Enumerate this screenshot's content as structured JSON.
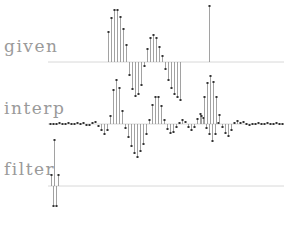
{
  "labels": {
    "given": "given",
    "interp": "interp",
    "filter": "filter"
  },
  "colors": {
    "stem": "#8a8a8a",
    "marker": "#333333",
    "baseline": "#d8d8d8",
    "label": "#9a9a9a"
  },
  "chart_data": {
    "type": "stem",
    "title": "",
    "panels": [
      {
        "name": "given",
        "baseline_y": 62,
        "x_start": 48,
        "x_end": 284,
        "points": [
          [
            108,
            -30
          ],
          [
            111,
            -44
          ],
          [
            114,
            -52
          ],
          [
            117,
            -52
          ],
          [
            120,
            -45
          ],
          [
            123,
            -33
          ],
          [
            126,
            -17
          ],
          [
            129,
            13
          ],
          [
            132,
            27
          ],
          [
            135,
            34
          ],
          [
            138,
            32
          ],
          [
            141,
            23
          ],
          [
            144,
            4
          ],
          [
            147,
            -13
          ],
          [
            150,
            -24
          ],
          [
            153,
            -27
          ],
          [
            156,
            -24
          ],
          [
            159,
            -15
          ],
          [
            162,
            -6
          ],
          [
            165,
            7
          ],
          [
            168,
            18
          ],
          [
            171,
            26
          ],
          [
            174,
            32
          ],
          [
            177,
            35
          ],
          [
            180,
            38
          ],
          [
            209,
            -56
          ]
        ]
      },
      {
        "name": "interp",
        "baseline_y": 124,
        "x_start": 48,
        "x_end": 284,
        "points": [
          [
            50,
            0
          ],
          [
            53,
            0
          ],
          [
            56,
            0
          ],
          [
            59,
            -1
          ],
          [
            62,
            0
          ],
          [
            65,
            0
          ],
          [
            68,
            -1
          ],
          [
            71,
            0
          ],
          [
            74,
            0
          ],
          [
            77,
            -1
          ],
          [
            80,
            0
          ],
          [
            83,
            -1
          ],
          [
            86,
            1
          ],
          [
            89,
            1
          ],
          [
            92,
            -1
          ],
          [
            95,
            -2
          ],
          [
            98,
            2
          ],
          [
            101,
            6
          ],
          [
            104,
            10
          ],
          [
            107,
            6
          ],
          [
            110,
            -8
          ],
          [
            113,
            -34
          ],
          [
            116,
            -44
          ],
          [
            119,
            -36
          ],
          [
            122,
            -13
          ],
          [
            125,
            4
          ],
          [
            128,
            13
          ],
          [
            131,
            22
          ],
          [
            134,
            29
          ],
          [
            137,
            33
          ],
          [
            140,
            27
          ],
          [
            143,
            20
          ],
          [
            146,
            10
          ],
          [
            149,
            -4
          ],
          [
            152,
            -19
          ],
          [
            155,
            -27
          ],
          [
            158,
            -27
          ],
          [
            161,
            -18
          ],
          [
            164,
            -4
          ],
          [
            167,
            5
          ],
          [
            170,
            9
          ],
          [
            173,
            8
          ],
          [
            176,
            3
          ],
          [
            179,
            -1
          ],
          [
            182,
            -4
          ],
          [
            185,
            -2
          ],
          [
            188,
            3
          ],
          [
            191,
            6
          ],
          [
            194,
            3
          ],
          [
            197,
            -5
          ],
          [
            200,
            -10
          ],
          [
            203,
            -6
          ],
          [
            206,
            4
          ],
          [
            209,
            10
          ],
          [
            212,
            17
          ],
          [
            215,
            10
          ],
          [
            218,
            -1
          ],
          [
            201,
            -8
          ],
          [
            204,
            -27
          ],
          [
            207,
            -41
          ],
          [
            210,
            -48
          ],
          [
            213,
            -42
          ],
          [
            216,
            -27
          ],
          [
            219,
            -9
          ],
          [
            222,
            3
          ],
          [
            225,
            9
          ],
          [
            228,
            12
          ],
          [
            231,
            6
          ],
          [
            234,
            -1
          ],
          [
            237,
            -3
          ],
          [
            240,
            -1
          ],
          [
            243,
            -2
          ],
          [
            246,
            0
          ],
          [
            249,
            1
          ],
          [
            252,
            0
          ],
          [
            255,
            0
          ],
          [
            258,
            -1
          ],
          [
            261,
            0
          ],
          [
            264,
            0
          ],
          [
            267,
            -1
          ],
          [
            270,
            0
          ],
          [
            273,
            0
          ],
          [
            276,
            -1
          ],
          [
            279,
            0
          ],
          [
            282,
            0
          ]
        ]
      },
      {
        "name": "filter",
        "baseline_y": 186,
        "x_start": 48,
        "x_end": 284,
        "points": [
          [
            51,
            -11
          ],
          [
            53,
            20
          ],
          [
            54,
            -46
          ],
          [
            56,
            20
          ],
          [
            58,
            -11
          ]
        ]
      }
    ]
  }
}
